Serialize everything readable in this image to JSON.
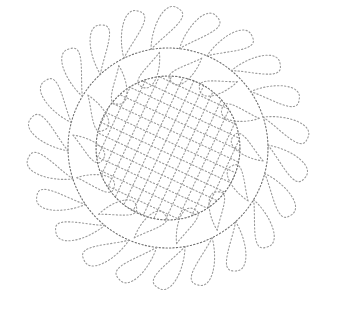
{
  "image": {
    "description": "Dotted-line quilting stencil: feathered wreath with crosshatched center",
    "width": 342,
    "height": 325,
    "background": "#ffffff",
    "stroke_color": "#9a9a9a",
    "spine_color": "#6f6f6f"
  },
  "wreath": {
    "center": [
      168,
      148
    ],
    "spine_radius": 100,
    "outer_feather_count": 22,
    "outer_feather_length": 46,
    "inner_feather_count": 14,
    "inner_feather_length": 36,
    "rotation_deg": -18
  },
  "crosshatch": {
    "radius": 72,
    "spacing": 11,
    "angle_deg": 25
  }
}
